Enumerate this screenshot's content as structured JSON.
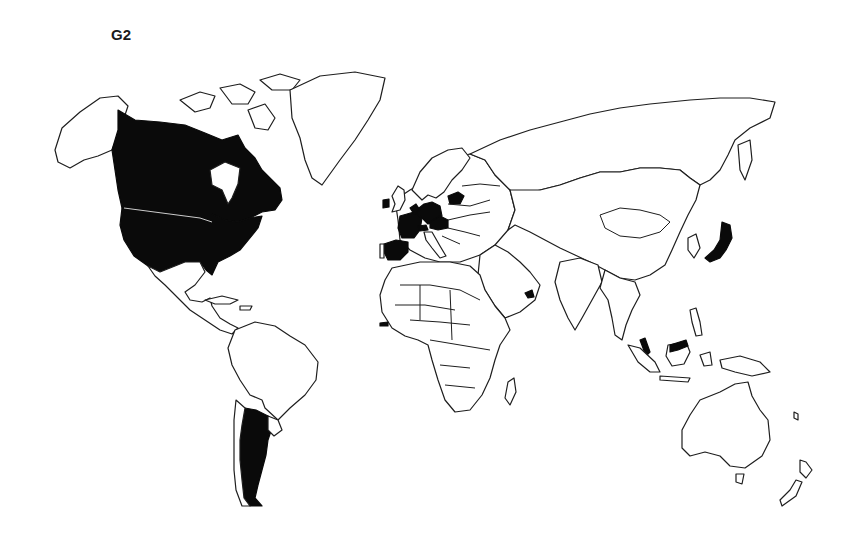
{
  "map": {
    "title": "G2",
    "projection": "world outline map",
    "fill_color": "#0a0a0a",
    "outline_color": "#1e1e1e",
    "background": "#ffffff",
    "highlighted_countries": [
      "Canada",
      "United States",
      "Argentina",
      "Ireland",
      "France",
      "Spain",
      "Belgium",
      "Netherlands",
      "Luxembourg",
      "Germany",
      "Switzerland",
      "Austria",
      "Czech Republic",
      "Lithuania",
      "United Arab Emirates",
      "Gambia",
      "Japan",
      "Malaysia"
    ],
    "non_highlighted_regions": [
      "Alaska",
      "Greenland",
      "Mexico",
      "Central America",
      "South America (other)",
      "United Kingdom",
      "Scandinavia",
      "Russia",
      "Africa (other)",
      "Middle East (other)",
      "China",
      "India",
      "Southeast Asia (other)",
      "Australia",
      "New Zealand"
    ]
  }
}
